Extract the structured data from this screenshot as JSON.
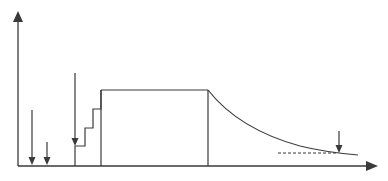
{
  "diagram": {
    "type": "schematic time profile",
    "colors": {
      "line": "#3a3a3a",
      "background": "#ffffff"
    },
    "axes": {
      "origin": [
        18,
        166
      ],
      "x_axis": {
        "end": [
          378,
          166
        ],
        "arrow": true,
        "label": ""
      },
      "y_axis": {
        "end": [
          18,
          10
        ],
        "arrow": true,
        "label": ""
      }
    },
    "arrows": [
      {
        "id": "arrow-1",
        "x": 32,
        "y_start": 110,
        "y_end": 165
      },
      {
        "id": "arrow-2",
        "x": 47,
        "y_start": 142,
        "y_end": 165
      },
      {
        "id": "arrow-3",
        "x": 75,
        "y_start": 73,
        "y_end": 146
      },
      {
        "id": "arrow-4",
        "x": 339,
        "y_start": 131,
        "y_end": 152
      }
    ],
    "profile": {
      "staircase": [
        [
          75,
          166
        ],
        [
          75,
          146
        ],
        [
          85,
          146
        ],
        [
          85,
          128
        ],
        [
          93,
          128
        ],
        [
          93,
          109
        ],
        [
          101,
          109
        ],
        [
          101,
          90
        ]
      ],
      "plateau": {
        "x_start": 101,
        "x_end": 208,
        "y": 90
      },
      "rect_left_edge": {
        "x": 101,
        "y_top": 90,
        "y_bottom": 166
      },
      "rect_right_edge": {
        "x": 208,
        "y_top": 90,
        "y_bottom": 166
      },
      "decay_curve": {
        "start": [
          208,
          90
        ],
        "end": [
          358,
          155
        ]
      },
      "asymptote_dashed": {
        "x_start": 278,
        "x_end": 338,
        "y": 153
      }
    }
  }
}
